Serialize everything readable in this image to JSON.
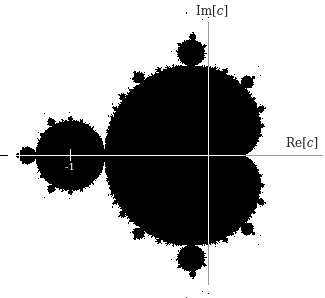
{
  "figure": {
    "width": 325,
    "height": 298,
    "set_color": "#000000",
    "background_color": "#ffffff",
    "axis_color_on_white": "#9a9a9a",
    "axis_color_on_black": "#ffffff"
  },
  "axes": {
    "x_label_prefix": "Re[",
    "x_label_var": "c",
    "x_label_suffix": "]",
    "y_label_prefix": "Im[",
    "y_label_var": "c",
    "y_label_suffix": "]",
    "tick_label": "-1",
    "origin_px": [
      208,
      155
    ],
    "scale_px_per_unit": 138,
    "x_axis_extent_px": [
      8,
      322
    ],
    "y_axis_extent_px": [
      22,
      284
    ]
  },
  "chart_data": {
    "type": "scatter",
    "xlabel": "Re[c]",
    "ylabel": "Im[c]",
    "tick_labels": [
      "-1"
    ],
    "xlim": [
      -1.5,
      0.85
    ],
    "ylim": [
      -0.95,
      1.0
    ],
    "features": [
      {
        "name": "main cardioid",
        "cusp": [
          0.25,
          0
        ],
        "leftmost": [
          -0.75,
          0
        ]
      },
      {
        "name": "period-2 bulb",
        "center": [
          -1,
          0
        ],
        "radius": 0.25
      },
      {
        "name": "period-3 bulb (upper)",
        "center": [
          -0.1226,
          0.7449
        ],
        "radius": 0.095
      },
      {
        "name": "period-3 bulb (lower)",
        "center": [
          -0.1226,
          -0.7449
        ],
        "radius": 0.095
      },
      {
        "name": "period-4 bulb",
        "center": [
          -1.3107,
          0
        ],
        "radius": 0.06
      }
    ],
    "grid": false,
    "legend": null
  }
}
